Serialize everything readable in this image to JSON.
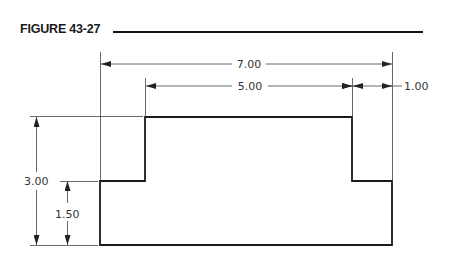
{
  "figure": {
    "title": "FIGURE 43-27"
  },
  "drawing": {
    "dimensions": {
      "overall_width": "7.00",
      "top_width": "5.00",
      "right_step": "1.00",
      "overall_height": "3.00",
      "step_height": "1.50"
    }
  },
  "colors": {
    "line": "#1a1a1a",
    "dim_line": "#444444"
  }
}
